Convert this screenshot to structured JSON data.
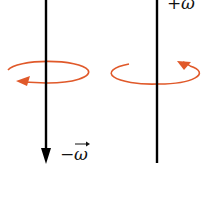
{
  "diagram": {
    "left_axis": {
      "label_sign": "−",
      "label_symbol": "ω",
      "direction": "down",
      "rotation": "clockwise-when-viewed-from-above"
    },
    "right_axis": {
      "label_sign": "+",
      "label_symbol": "ω",
      "direction": "up",
      "rotation": "counterclockwise-when-viewed-from-above"
    },
    "colors": {
      "axis": "#000000",
      "rotation_arrow": "#e0592a"
    }
  }
}
